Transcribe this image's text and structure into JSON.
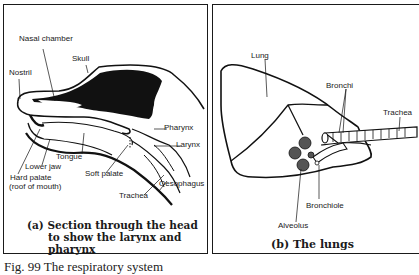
{
  "panel_a": {
    "labels": {
      "nasal_chamber": "Nasal chamber",
      "skull": "Skull",
      "nostril": "Nostril",
      "pharynx": "Pharynx",
      "larynx": "Larynx",
      "tongue": "Tongue",
      "lower_jaw": "Lower jaw",
      "hard_palate": "Hard palate",
      "hard_palate_note": "(roof of mouth)",
      "soft_palate": "Soft palate",
      "oesophagus": "Oesophagus",
      "trachea": "Trachea"
    },
    "caption_line1": "(a) Section through the head",
    "caption_line2": "to show the larynx and",
    "caption_line3": "pharynx"
  },
  "panel_b": {
    "labels": {
      "lung": "Lung",
      "bronchi": "Bronchi",
      "trachea": "Trachea",
      "bronchiole": "Bronchiole",
      "alveolus": "Alveolus"
    },
    "caption": "(b) The lungs"
  },
  "figure_caption": "Fig. 99 The respiratory system"
}
